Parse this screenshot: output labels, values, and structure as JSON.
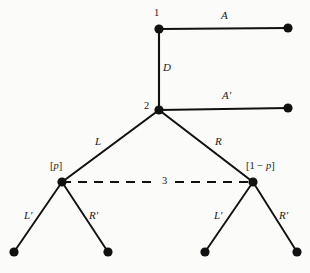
{
  "diagram": {
    "type": "game-tree",
    "background_color": "#fbfbfa",
    "stroke_color": "#111111",
    "nodes": [
      {
        "id": "n1",
        "label": "1",
        "kind": "decision",
        "x": 159,
        "y": 29,
        "label_x": 154,
        "label_y": 8
      },
      {
        "id": "t_A",
        "label": "",
        "kind": "terminal",
        "x": 288,
        "y": 28
      },
      {
        "id": "n2",
        "label": "2",
        "kind": "decision",
        "x": 159,
        "y": 110,
        "label_x": 144,
        "label_y": 101
      },
      {
        "id": "t_Aprime",
        "label": "",
        "kind": "terminal",
        "x": 288,
        "y": 108
      },
      {
        "id": "n3L",
        "label": "",
        "kind": "decision",
        "x": 62,
        "y": 182
      },
      {
        "id": "n3R",
        "label": "",
        "kind": "decision",
        "x": 253,
        "y": 182
      },
      {
        "id": "t_LL",
        "label": "",
        "kind": "terminal",
        "x": 14,
        "y": 252
      },
      {
        "id": "t_LR",
        "label": "",
        "kind": "terminal",
        "x": 108,
        "y": 252
      },
      {
        "id": "t_RL",
        "label": "",
        "kind": "terminal",
        "x": 205,
        "y": 252
      },
      {
        "id": "t_RR",
        "label": "",
        "kind": "terminal",
        "x": 297,
        "y": 252
      }
    ],
    "edges": [
      {
        "id": "e_A",
        "from": "n1",
        "to": "t_A",
        "label": "A",
        "label_x": 221,
        "label_y": 10
      },
      {
        "id": "e_D",
        "from": "n1",
        "to": "n2",
        "label": "D",
        "label_x": 163,
        "label_y": 62
      },
      {
        "id": "e_Aprime",
        "from": "n2",
        "to": "t_Aprime",
        "label": "A′",
        "label_x": 222,
        "label_y": 90
      },
      {
        "id": "e_L",
        "from": "n2",
        "to": "n3L",
        "label": "L",
        "label_x": 95,
        "label_y": 136
      },
      {
        "id": "e_R",
        "from": "n2",
        "to": "n3R",
        "label": "R",
        "label_x": 215,
        "label_y": 136
      },
      {
        "id": "e_LLprime",
        "from": "n3L",
        "to": "t_LL",
        "label": "L′",
        "label_x": 24,
        "label_y": 210
      },
      {
        "id": "e_LRprime",
        "from": "n3L",
        "to": "t_LR",
        "label": "R′",
        "label_x": 89,
        "label_y": 210
      },
      {
        "id": "e_RLprime",
        "from": "n3R",
        "to": "t_RL",
        "label": "L′",
        "label_x": 214,
        "label_y": 210
      },
      {
        "id": "e_RRprime",
        "from": "n3R",
        "to": "t_RR",
        "label": "R′",
        "label_x": 279,
        "label_y": 210
      }
    ],
    "information_set": {
      "id": "infoset-3",
      "label": "3",
      "label_x": 162,
      "label_y": 176,
      "style": "dashed",
      "from": "n3L",
      "to": "n3R",
      "from_x": 62,
      "from_y": 182,
      "to_x": 253,
      "to_y": 182
    },
    "probability_labels": [
      {
        "id": "prob-left",
        "text": "[p]",
        "prefix": "[",
        "variable": "p",
        "suffix": "]",
        "x": 50,
        "y": 161
      },
      {
        "id": "prob-right",
        "text": "[1 − p]",
        "prefix": "[1 − ",
        "variable": "p",
        "suffix": "]",
        "x": 246,
        "y": 161
      }
    ]
  }
}
